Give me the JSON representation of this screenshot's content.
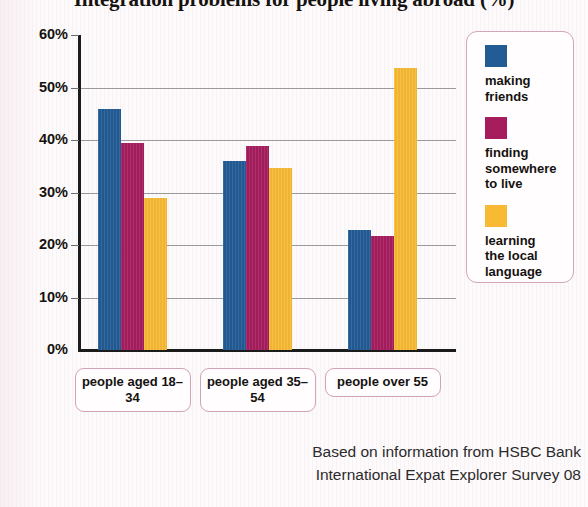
{
  "chart_data": {
    "type": "bar",
    "title": "Integration problems for people living abroad (%)",
    "xlabel": "",
    "ylabel": "",
    "ylim": [
      0,
      60
    ],
    "ytick_step": 10,
    "ytick_labels": [
      "0%",
      "10%",
      "20%",
      "30%",
      "40%",
      "50%",
      "60%"
    ],
    "ytick_values": [
      0,
      10,
      20,
      30,
      40,
      50,
      60
    ],
    "grid": true,
    "legend_position": "right",
    "categories": [
      "people aged\n18–34",
      "people aged\n35–54",
      "people over\n55"
    ],
    "series": [
      {
        "name": "making\nfriends",
        "color": "#235b95",
        "values": [
          46,
          36,
          22.8
        ]
      },
      {
        "name": "finding\nsomewhere\nto live",
        "color": "#a61d5e",
        "values": [
          39.5,
          38.8,
          21.8
        ]
      },
      {
        "name": "learning\nthe local\nlanguage",
        "color": "#f7ba33",
        "values": [
          29,
          34.7,
          53.8
        ]
      }
    ],
    "source": "Based on information from HSBC Bank\nInternational Expat Explorer Survey 08"
  },
  "colors": {
    "series_1": "#235b95",
    "series_2": "#a61d5e",
    "series_3": "#f7ba33",
    "legend_border": "#d4a4ba",
    "axis": "#1b1b1b",
    "gridline": "#9a9a9a",
    "background": "#fdfafb"
  }
}
